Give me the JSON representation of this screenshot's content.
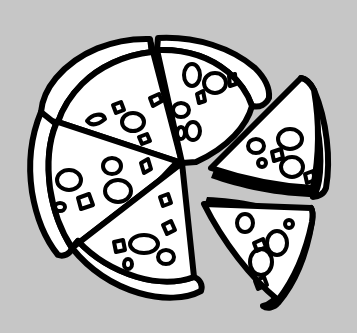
{
  "image": {
    "title": "Pizza with separated slices",
    "subject": "pizza",
    "style": "black-and-white line art clip art",
    "width": 357,
    "height": 333,
    "alt_text": "Line drawing of a pizza cut into slices, with two slices pulled away to the right"
  },
  "colors": {
    "background": "#c6c6c6",
    "outline": "#000000",
    "fill": "#ffffff",
    "shadow": "#000000"
  },
  "composition": {
    "attached_slice_count": 4,
    "detached_slice_count": 2,
    "total_slice_count": 6,
    "center_x": 182,
    "center_y": 163
  },
  "parts": [
    {
      "name": "slice-top-left",
      "label": "Top left slice",
      "attached": true,
      "topping_count": 5
    },
    {
      "name": "slice-top-right",
      "label": "Top right slice",
      "attached": true,
      "topping_count": 7
    },
    {
      "name": "slice-left",
      "label": "Left slice",
      "attached": true,
      "topping_count": 6
    },
    {
      "name": "slice-bottom",
      "label": "Bottom slice",
      "attached": true,
      "topping_count": 6
    },
    {
      "name": "slice-detached-upper-right",
      "label": "Detached upper right slice",
      "attached": false,
      "topping_count": 6
    },
    {
      "name": "slice-detached-lower-right",
      "label": "Detached lower right slice",
      "attached": false,
      "topping_count": 6
    }
  ]
}
